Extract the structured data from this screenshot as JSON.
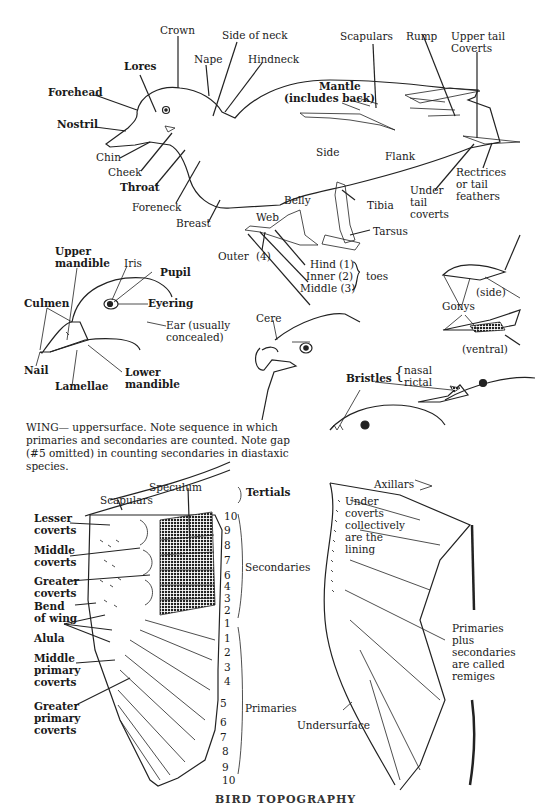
{
  "body_diagram": {
    "labels": {
      "crown": "Crown",
      "side_of_neck": "Side of neck",
      "nape": "Nape",
      "hindneck": "Hindneck",
      "lores": "Lores",
      "forehead": "Forehead",
      "nostril": "Nostril",
      "chin": "Chin",
      "cheek": "Cheek",
      "throat": "Throat",
      "foreneck": "Foreneck",
      "breast": "Breast",
      "scapulars": "Scapulars",
      "rump": "Rump",
      "upper_tail_coverts": "Upper tail Coverts",
      "mantle": "Mantle",
      "mantle_note": "(includes back)",
      "side": "Side",
      "flank": "Flank",
      "rectrices": "Rectrices or tail feathers",
      "under_tail_coverts": "Under tail coverts",
      "belly": "Belly",
      "tibia": "Tibia",
      "tarsus": "Tarsus",
      "web": "Web",
      "outer": "Outer",
      "outer_num": "(4)"
    },
    "toes": {
      "hind": "Hind (1)",
      "inner": "Inner (2)",
      "middle": "Middle (3)",
      "group_label": "toes"
    }
  },
  "duck_head": {
    "upper_mandible": "Upper mandible",
    "iris": "Iris",
    "pupil": "Pupil",
    "culmen": "Culmen",
    "eyering": "Eyering",
    "ear": "Ear (usually concealed)",
    "nail": "Nail",
    "lamellae": "Lamellae",
    "lower_mandible": "Lower mandible"
  },
  "hawk_head": {
    "cere": "Cere"
  },
  "gonys": {
    "label": "Gonys",
    "side": "(side)",
    "ventral": "(ventral)"
  },
  "bristles": {
    "label": "Bristles",
    "nasal": "nasal",
    "rictal": "rictal"
  },
  "wing_caption": "WING— uppersurface. Note sequence in which primaries and secondaries are counted. Note gap (#5 omitted) in counting secondaries in diastaxic species.",
  "wing_upper": {
    "speculum": "Speculum",
    "scapulars": "Scapulars",
    "tertials": "Tertials",
    "lesser_coverts": "Lesser coverts",
    "middle_coverts": "Middle coverts",
    "greater_coverts": "Greater coverts",
    "bend_of_wing": "Bend of wing",
    "alula": "Alula",
    "middle_primary_coverts": "Middle primary coverts",
    "greater_primary_coverts": "Greater primary coverts",
    "secondaries": "Secondaries",
    "primaries": "Primaries",
    "secondary_numbers": [
      "10",
      "9",
      "8",
      "7",
      "6",
      "4",
      "3",
      "2",
      "1"
    ],
    "primary_numbers": [
      "1",
      "2",
      "3",
      "4",
      "5",
      "6",
      "7",
      "8",
      "9",
      "10"
    ]
  },
  "wing_under": {
    "axillars": "Axillars",
    "under_coverts": "Under coverts collectively are the lining",
    "remiges_note": "Primaries plus secondaries are called remiges",
    "undersurface": "Undersurface"
  },
  "footer": {
    "title": "BIRD TOPOGRAPHY"
  }
}
